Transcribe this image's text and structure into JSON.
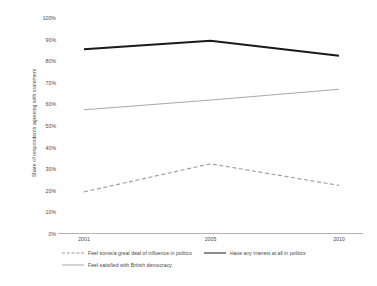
{
  "chart_data": {
    "type": "line",
    "title": "",
    "xlabel": "",
    "ylabel": "Share of respondents agreeing with statement",
    "categories": [
      "2001",
      "2005",
      "2010"
    ],
    "x": [
      2001,
      2005,
      2010
    ],
    "ylim": [
      0,
      100
    ],
    "ytick_labels": [
      "0%",
      "10%",
      "20%",
      "30%",
      "40%",
      "50%",
      "60%",
      "70%",
      "80%",
      "90%",
      "100%"
    ],
    "ytick_values": [
      0,
      10,
      20,
      30,
      40,
      50,
      60,
      70,
      80,
      90,
      100
    ],
    "grid": false,
    "legend_position": "bottom",
    "series": [
      {
        "name": "Feel some/a great deal of influence in politics",
        "values": [
          19.5,
          32.5,
          22.5
        ],
        "style": "dashed",
        "color": "#9a9a9a",
        "width": 1.1
      },
      {
        "name": "Have any interest at all in politics",
        "values": [
          85.5,
          89.5,
          82.5
        ],
        "style": "solid",
        "color": "#1a1a1a",
        "width": 2.0
      },
      {
        "name": "Feel satisfied with British democracy",
        "values": [
          57.5,
          62.0,
          67.0
        ],
        "style": "solid",
        "color": "#a8a8a8",
        "width": 1.0
      }
    ]
  },
  "axis": {
    "line_color": "#b4b4b4"
  },
  "legend": {
    "entries": [
      {
        "label": "Feel some/a great deal of influence in politics",
        "swatch": "dashed-gray-line",
        "row": 0,
        "col": 0
      },
      {
        "label": "Have any interest at all in politics",
        "swatch": "solid-black-line",
        "row": 0,
        "col": 1
      },
      {
        "label": "Feel satisfied with British democracy",
        "swatch": "solid-gray-line",
        "row": 1,
        "col": 0
      }
    ]
  }
}
